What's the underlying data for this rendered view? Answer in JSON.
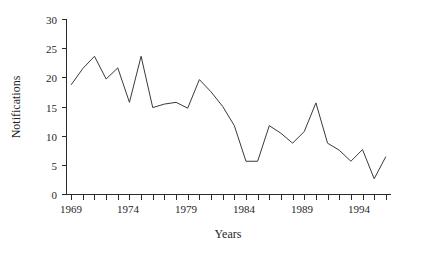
{
  "chart_data": {
    "type": "line",
    "title": "",
    "xlabel": "Years",
    "ylabel": "Notifications",
    "xlim": [
      1968.6,
      1996.4
    ],
    "ylim": [
      0,
      30
    ],
    "grid": false,
    "legend": false,
    "y_ticks": [
      0,
      5,
      10,
      15,
      20,
      25,
      30
    ],
    "y_tick_labels": [
      "0",
      "5",
      "10",
      "15",
      "20",
      "25",
      "30"
    ],
    "x_ticks": [
      1969,
      1970,
      1971,
      1972,
      1973,
      1974,
      1975,
      1976,
      1977,
      1978,
      1979,
      1980,
      1981,
      1982,
      1983,
      1984,
      1985,
      1986,
      1987,
      1988,
      1989,
      1990,
      1991,
      1992,
      1993,
      1994,
      1995,
      1996
    ],
    "x_tick_labels": [
      "1969",
      "1974",
      "1979",
      "1984",
      "1989",
      "1994"
    ],
    "labeled_x_ticks": [
      1969,
      1974,
      1979,
      1984,
      1989,
      1994
    ],
    "x": [
      1969,
      1970,
      1971,
      1972,
      1973,
      1974,
      1975,
      1976,
      1977,
      1978,
      1979,
      1980,
      1981,
      1982,
      1983,
      1984,
      1985,
      1986,
      1987,
      1988,
      1989,
      1990,
      1991,
      1992,
      1993,
      1994,
      1995,
      1996
    ],
    "values": [
      18.8,
      21.6,
      23.7,
      19.8,
      21.7,
      15.8,
      23.7,
      14.9,
      15.5,
      15.8,
      14.8,
      19.7,
      17.6,
      15.1,
      11.8,
      5.7,
      5.7,
      11.8,
      10.5,
      8.8,
      10.8,
      15.7,
      8.8,
      7.6,
      5.7,
      7.7,
      2.7,
      6.5
    ],
    "series": [
      {
        "name": "Notifications",
        "color": "#3a3a3a",
        "values": [
          18.8,
          21.6,
          23.7,
          19.8,
          21.7,
          15.8,
          23.7,
          14.9,
          15.5,
          15.8,
          14.8,
          19.7,
          17.6,
          15.1,
          11.8,
          5.7,
          5.7,
          11.8,
          10.5,
          8.8,
          10.8,
          15.7,
          8.8,
          7.6,
          5.7,
          7.7,
          2.7,
          6.5
        ]
      }
    ]
  },
  "axes": {
    "y_title": "Notifications",
    "x_title": "Years"
  }
}
